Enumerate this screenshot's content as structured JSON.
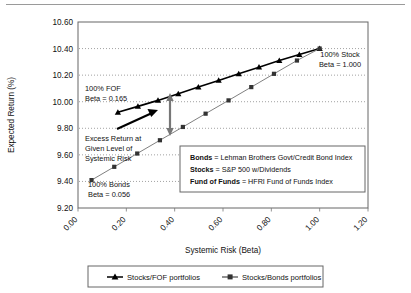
{
  "chart_data": {
    "type": "line",
    "title": "",
    "xlabel": "Systemic Risk (Beta)",
    "ylabel": "Expected Return (%)",
    "xlim": [
      0.0,
      1.2
    ],
    "ylim": [
      9.2,
      10.6
    ],
    "xticks": [
      "0.00",
      "0.20",
      "0.40",
      "0.60",
      "0.80",
      "1.00",
      "1.20"
    ],
    "yticks": [
      "9.20",
      "9.40",
      "9.60",
      "9.80",
      "10.00",
      "10.20",
      "10.40",
      "10.60"
    ],
    "grid": "horizontal-dotted",
    "legend_position": "bottom",
    "series": [
      {
        "name": "Stocks/FOF portfolios",
        "marker": "triangle",
        "color": "#000000",
        "x": [
          0.165,
          0.248,
          0.331,
          0.415,
          0.498,
          0.582,
          0.665,
          0.749,
          0.833,
          0.916,
          1.0
        ],
        "y": [
          9.92,
          9.965,
          10.01,
          10.06,
          10.11,
          10.16,
          10.21,
          10.26,
          10.31,
          10.355,
          10.4
        ]
      },
      {
        "name": "Stocks/Bonds portfolios",
        "marker": "square",
        "color": "#808080",
        "x": [
          0.056,
          0.15,
          0.245,
          0.339,
          0.434,
          0.528,
          0.623,
          0.717,
          0.811,
          0.906,
          1.0
        ],
        "y": [
          9.41,
          9.51,
          9.61,
          9.71,
          9.81,
          9.91,
          10.01,
          10.11,
          10.21,
          10.31,
          10.4
        ]
      }
    ],
    "annotations": [
      {
        "id": "fof-label",
        "lines": [
          "100% FOF",
          "Beta = 0.165"
        ]
      },
      {
        "id": "stock-label",
        "lines": [
          "100% Stock",
          "Beta = 1.000"
        ]
      },
      {
        "id": "bonds-label",
        "lines": [
          "100% Bonds",
          "Beta = 0.056"
        ]
      },
      {
        "id": "excess-label",
        "lines": [
          "Excess Return at",
          "Given Level of",
          "Systemic Risk"
        ]
      }
    ]
  },
  "yaxis": {
    "title": "Expected Return (%)",
    "ticks": [
      "10.60",
      "10.40",
      "10.20",
      "10.00",
      "9.80",
      "9.60",
      "9.40",
      "9.20"
    ]
  },
  "xaxis": {
    "title": "Systemic Risk (Beta)",
    "ticks": [
      "0.00",
      "0.20",
      "0.40",
      "0.60",
      "0.80",
      "1.00",
      "1.20"
    ]
  },
  "annotations": {
    "fof": {
      "line1": "100% FOF",
      "line2": "Beta = 0.165"
    },
    "stock": {
      "line1": "100% Stock",
      "line2": "Beta = 1.000"
    },
    "bonds": {
      "line1": "100% Bonds",
      "line2": "Beta = 0.056"
    },
    "excess": {
      "line1": "Excess Return at",
      "line2": "Given Level of",
      "line3": "Systemic Risk"
    }
  },
  "definitions": [
    {
      "term": "Bonds",
      "eq": " = ",
      "value": "Lehman Brothers Govt/Credit Bond Index"
    },
    {
      "term": "Stocks",
      "eq": " = ",
      "value": "S&P 500 w/Dividends"
    },
    {
      "term": "Fund of Funds",
      "eq": " = ",
      "value": "HFRI Fund of Funds Index"
    }
  ],
  "legend": {
    "items": [
      {
        "label": "Stocks/FOF portfolios",
        "marker": "triangle",
        "color": "#000000"
      },
      {
        "label": "Stocks/Bonds portfolios",
        "marker": "square",
        "color": "#555555"
      }
    ]
  }
}
